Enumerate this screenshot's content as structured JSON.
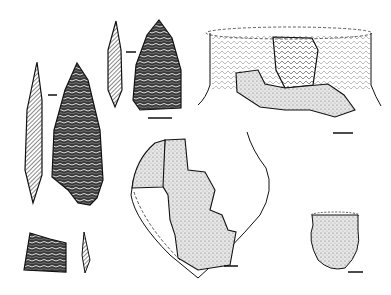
{
  "figure": {
    "background": "#ffffff",
    "ink": "#111111",
    "stipple": "#555555",
    "artifacts": [
      {
        "id": "large-point",
        "kind": "flaked stone point",
        "views": [
          "profile",
          "face"
        ]
      },
      {
        "id": "small-point",
        "kind": "flaked stone point",
        "views": [
          "profile",
          "face"
        ]
      },
      {
        "id": "fragment",
        "kind": "stone fragment",
        "views": [
          "face",
          "profile"
        ]
      },
      {
        "id": "decorated-vessel",
        "kind": "ceramic vessel rim reconstruction"
      },
      {
        "id": "conical-vessel",
        "kind": "ceramic pointed-base vessel reconstruction"
      },
      {
        "id": "small-bowl",
        "kind": "small ceramic pot"
      }
    ],
    "scale_bars": 4
  }
}
